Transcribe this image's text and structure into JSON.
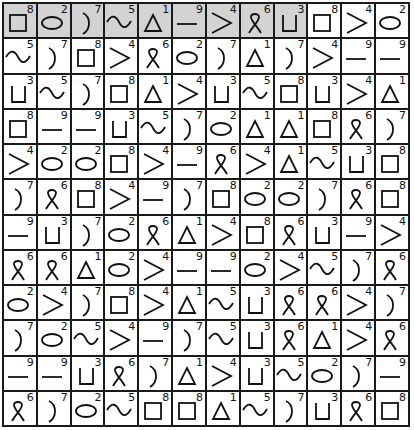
{
  "grid": {
    "rows": 12,
    "cols": 12,
    "shaded_header_count": 9,
    "colors": {
      "shaded": "#d3d3d3",
      "border": "#1a1a1a",
      "background": "#ffffff"
    },
    "legend": {
      "1": "triangle-icon",
      "2": "ellipse-icon",
      "3": "cup-icon",
      "4": "greater-than-icon",
      "5": "wave-icon",
      "6": "ribbon-icon",
      "7": "paren-icon",
      "8": "square-icon",
      "9": "dash-icon"
    },
    "cells": [
      [
        8,
        2,
        7,
        5,
        1,
        9,
        4,
        6,
        3,
        8,
        4,
        2
      ],
      [
        5,
        7,
        8,
        4,
        6,
        2,
        7,
        1,
        7,
        4,
        9,
        9
      ],
      [
        3,
        5,
        7,
        8,
        1,
        4,
        3,
        5,
        8,
        3,
        4,
        1
      ],
      [
        8,
        9,
        9,
        3,
        5,
        7,
        2,
        1,
        1,
        8,
        6,
        7
      ],
      [
        4,
        2,
        2,
        8,
        4,
        9,
        6,
        4,
        1,
        5,
        3,
        8
      ],
      [
        7,
        6,
        8,
        4,
        9,
        7,
        8,
        2,
        2,
        7,
        6,
        8
      ],
      [
        9,
        3,
        7,
        2,
        6,
        1,
        4,
        8,
        6,
        3,
        9,
        4
      ],
      [
        6,
        6,
        1,
        2,
        4,
        9,
        9,
        2,
        4,
        5,
        7,
        6
      ],
      [
        2,
        4,
        7,
        8,
        4,
        1,
        5,
        3,
        6,
        6,
        4,
        7
      ],
      [
        7,
        2,
        5,
        4,
        9,
        7,
        5,
        3,
        6,
        1,
        4,
        6
      ],
      [
        9,
        9,
        3,
        6,
        7,
        1,
        4,
        3,
        5,
        2,
        7,
        9
      ],
      [
        6,
        7,
        2,
        5,
        8,
        8,
        1,
        5,
        7,
        3,
        6,
        8
      ]
    ]
  }
}
